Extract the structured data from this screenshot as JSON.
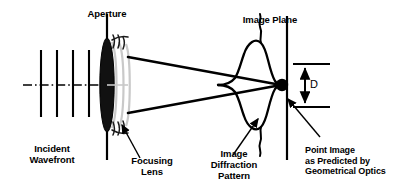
{
  "figure": {
    "background_color": "#ffffff",
    "ink_color": "#000000",
    "wavefront_color": "#c8c8c8",
    "width": 413,
    "height": 192
  },
  "labels": {
    "aperture": "Aperture",
    "image_plane": "Image Plane",
    "incident_wavefront": "Incident\nWavefront",
    "focusing_lens": "Focusing\nLens",
    "image_diffraction_pattern": "Image\nDiffraction\nPattern",
    "point_image": "Point Image\nas Predicted by\nGeometrical Optics",
    "dimension_d": "D"
  },
  "elements": {
    "incident_wavefront_lines": 4,
    "optical_axis_style": "dash-dot",
    "lens_shape": "filled-ellipse",
    "diffraction_curve": "sinc-squared-profile",
    "point_image_marker": "filled-circle"
  },
  "icons": {
    "leader_arrow": "arrow-icon",
    "dimension_arrow": "double-headed-arrow-icon"
  }
}
